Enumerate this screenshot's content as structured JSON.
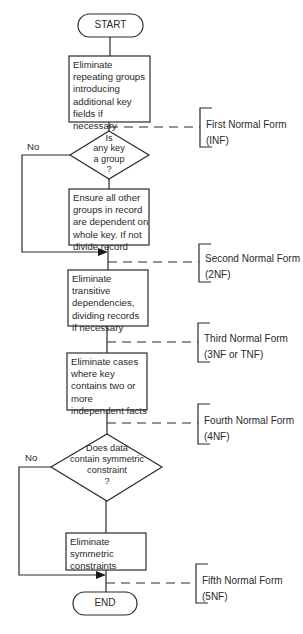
{
  "diagram": {
    "type": "flowchart",
    "start": {
      "label": "START"
    },
    "end": {
      "label": "END"
    },
    "steps": [
      {
        "id": "s1",
        "text": "Eliminate\nrepeating groups\nintroducing\nadditional key\nfields if\nnecessary"
      },
      {
        "id": "s2",
        "text": "Ensure all other\ngroups in record\nare dependent on\nwhole key. If not\ndivide record"
      },
      {
        "id": "s3",
        "text": "Eliminate\ntransitive\ndependencies,\ndividing records\nif necessary"
      },
      {
        "id": "s4",
        "text": "Eliminate cases\nwhere key\ncontains two or\nmore\nindependent facts"
      },
      {
        "id": "s5",
        "text": "Eliminate\nsymmetric\nconstraints"
      }
    ],
    "decisions": [
      {
        "id": "d1",
        "text": "Is\nany key\na group\n?",
        "no_label": "No"
      },
      {
        "id": "d2",
        "text": "Does data\ncontain symmetric\nconstraint\n?",
        "no_label": "No"
      }
    ],
    "normal_forms": [
      {
        "name": "First Normal Form",
        "abbr": "(INF)"
      },
      {
        "name": "Second Normal Form",
        "abbr": "(2NF)"
      },
      {
        "name": "Third Normal Form",
        "abbr": "(3NF or TNF)"
      },
      {
        "name": "Fourth Normal Form",
        "abbr": "(4NF)"
      },
      {
        "name": "Fifth Normal Form",
        "abbr": "(5NF)"
      }
    ],
    "colors": {
      "line": "#2a2a2a",
      "background": "#ffffff"
    }
  }
}
